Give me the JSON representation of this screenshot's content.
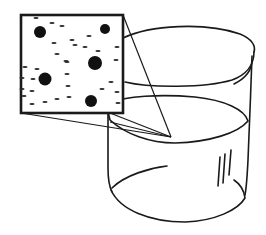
{
  "diagram": {
    "stroke_color": "#1a1a1a",
    "background_color": "#ffffff",
    "magnifier": {
      "box": {
        "x": 21,
        "y": 15,
        "w": 102,
        "h": 98
      },
      "focus_point": {
        "x": 171,
        "y": 137
      },
      "large_particles": [
        {
          "x": 40,
          "y": 32,
          "r": 6
        },
        {
          "x": 105,
          "y": 29,
          "r": 5
        },
        {
          "x": 95,
          "y": 63,
          "r": 7
        },
        {
          "x": 45,
          "y": 79,
          "r": 6.5
        },
        {
          "x": 91,
          "y": 101,
          "r": 6
        }
      ],
      "small_particles": [
        [
          36,
          18
        ],
        [
          52,
          23
        ],
        [
          62,
          26
        ],
        [
          89,
          36
        ],
        [
          72,
          40
        ],
        [
          54,
          43
        ],
        [
          75,
          45
        ],
        [
          85,
          47
        ],
        [
          57,
          54
        ],
        [
          66,
          61
        ],
        [
          98,
          51
        ],
        [
          117,
          47
        ],
        [
          116,
          60
        ],
        [
          25,
          67
        ],
        [
          37,
          69
        ],
        [
          67,
          62
        ],
        [
          22,
          78
        ],
        [
          33,
          79
        ],
        [
          67,
          74
        ],
        [
          22,
          89
        ],
        [
          32,
          91
        ],
        [
          68,
          86
        ],
        [
          102,
          89
        ],
        [
          111,
          82
        ],
        [
          117,
          92
        ],
        [
          32,
          104
        ],
        [
          45,
          102
        ],
        [
          57,
          99
        ],
        [
          69,
          97
        ],
        [
          118,
          103
        ],
        [
          24,
          96
        ]
      ]
    },
    "beaker": {
      "rim": {
        "cx": 182,
        "cy": 60,
        "rx": 74,
        "ry": 32
      },
      "liquid_surface": {
        "cx": 180,
        "cy": 118,
        "rx": 72,
        "ry": 30
      },
      "bottom": {
        "cx": 180,
        "cy": 190,
        "rx": 70,
        "ry": 32
      },
      "highlight_marks": [
        {
          "x1": 218,
          "y1": 158,
          "x2": 215,
          "y2": 190
        },
        {
          "x1": 224,
          "y1": 154,
          "x2": 221,
          "y2": 186
        },
        {
          "x1": 230,
          "y1": 150,
          "x2": 228,
          "y2": 178
        }
      ]
    }
  }
}
